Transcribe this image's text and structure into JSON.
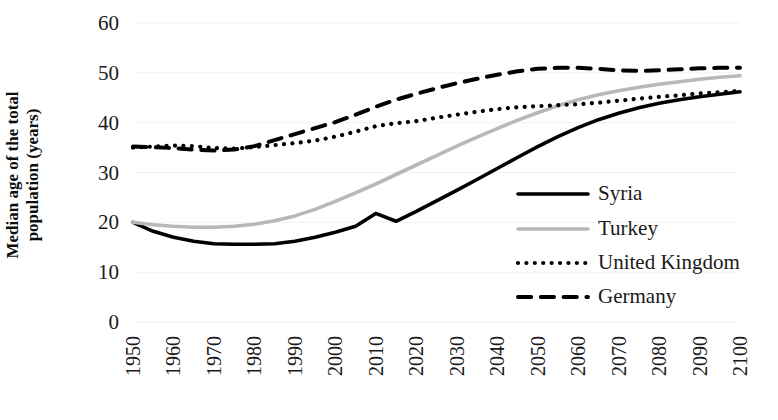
{
  "chart_data": {
    "type": "line",
    "title": "",
    "xlabel": "",
    "ylabel": "Median age of the total population (years)",
    "xlim": [
      1950,
      2100
    ],
    "ylim": [
      0,
      60
    ],
    "ytick_step": 10,
    "grid": "horizontal-faint",
    "legend_position": "inside-right-lower",
    "x_tick_labels": [
      "1950",
      "1960",
      "1970",
      "1980",
      "1990",
      "2000",
      "2010",
      "2020",
      "2030",
      "2040",
      "2050",
      "2060",
      "2070",
      "2080",
      "2090",
      "2100"
    ],
    "y_tick_labels": [
      "0",
      "10",
      "20",
      "30",
      "40",
      "50",
      "60"
    ],
    "x": [
      1950,
      1955,
      1960,
      1965,
      1970,
      1975,
      1980,
      1985,
      1990,
      1995,
      2000,
      2005,
      2010,
      2015,
      2020,
      2025,
      2030,
      2035,
      2040,
      2045,
      2050,
      2055,
      2060,
      2065,
      2070,
      2075,
      2080,
      2085,
      2090,
      2095,
      2100
    ],
    "series": [
      {
        "name": "Syria",
        "color": "#000000",
        "style": "solid",
        "width": 3.6,
        "values": [
          20.0,
          18.2,
          17.0,
          16.2,
          15.7,
          15.6,
          15.6,
          15.7,
          16.2,
          17.0,
          18.0,
          19.2,
          21.8,
          20.2,
          22.2,
          24.3,
          26.4,
          28.6,
          30.8,
          33.0,
          35.2,
          37.2,
          39.0,
          40.6,
          41.9,
          43.0,
          43.9,
          44.6,
          45.2,
          45.7,
          46.2
        ]
      },
      {
        "name": "Turkey",
        "color": "#b8b8b8",
        "style": "solid",
        "width": 3.6,
        "values": [
          20.0,
          19.5,
          19.2,
          19.0,
          19.0,
          19.2,
          19.6,
          20.3,
          21.3,
          22.6,
          24.2,
          25.9,
          27.7,
          29.6,
          31.5,
          33.4,
          35.3,
          37.1,
          38.8,
          40.5,
          42.0,
          43.4,
          44.6,
          45.6,
          46.4,
          47.1,
          47.7,
          48.2,
          48.7,
          49.1,
          49.4
        ]
      },
      {
        "name": "United Kingdom",
        "color": "#000000",
        "style": "dotted",
        "width": 4.2,
        "values": [
          35.0,
          35.2,
          35.4,
          35.3,
          34.9,
          34.8,
          35.1,
          35.5,
          35.9,
          36.4,
          37.2,
          38.2,
          39.3,
          39.9,
          40.3,
          41.0,
          41.6,
          42.2,
          42.7,
          43.1,
          43.3,
          43.5,
          43.7,
          44.0,
          44.4,
          44.8,
          45.2,
          45.5,
          45.9,
          46.1,
          46.4
        ]
      },
      {
        "name": "Germany",
        "color": "#000000",
        "style": "dashed",
        "width": 4.0,
        "values": [
          35.2,
          35.1,
          34.9,
          34.6,
          34.4,
          34.6,
          35.3,
          36.5,
          37.7,
          38.9,
          40.1,
          41.6,
          43.2,
          44.6,
          45.8,
          46.9,
          47.9,
          48.8,
          49.6,
          50.3,
          50.8,
          51.0,
          51.0,
          50.8,
          50.5,
          50.4,
          50.5,
          50.7,
          50.9,
          51.0,
          51.0
        ]
      }
    ]
  },
  "legend": {
    "items": [
      {
        "label": "Syria"
      },
      {
        "label": "Turkey"
      },
      {
        "label": "United Kingdom"
      },
      {
        "label": "Germany"
      }
    ]
  }
}
